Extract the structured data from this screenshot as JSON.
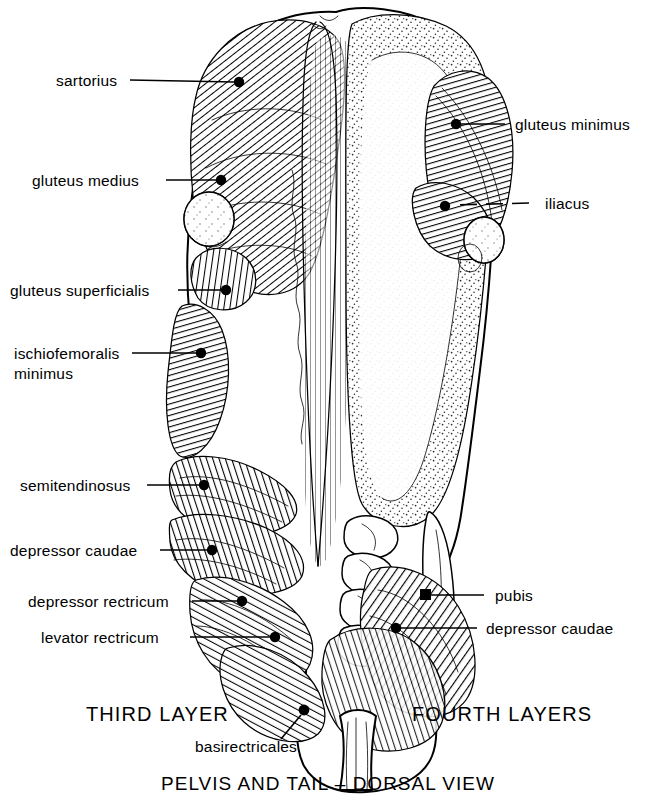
{
  "figure": {
    "title": "PELVIS AND TAIL – DORSAL VIEW",
    "left_caption": "THIRD  LAYER",
    "right_caption": "FOURTH LAYERS",
    "center_label": "basirectricales",
    "colors": {
      "ink": "#000000",
      "paper": "#ffffff"
    }
  },
  "labels_left": [
    {
      "id": "sartorius",
      "text": "sartorius"
    },
    {
      "id": "gluteus-medius",
      "text": "gluteus medius"
    },
    {
      "id": "gluteus-superficialis",
      "text": "gluteus superficialis"
    },
    {
      "id": "ischiofemoralis-minimus-line1",
      "text": "ischiofemoralis"
    },
    {
      "id": "ischiofemoralis-minimus-line2",
      "text": "minimus"
    },
    {
      "id": "semitendinosus",
      "text": "semitendinosus"
    },
    {
      "id": "depressor-caudae-left",
      "text": "depressor caudae"
    },
    {
      "id": "depressor-rectricum",
      "text": "depressor rectricum"
    },
    {
      "id": "levator-rectricum",
      "text": "levator rectricum"
    }
  ],
  "labels_right": [
    {
      "id": "gluteus-minimus",
      "text": "gluteus minimus"
    },
    {
      "id": "iliacus",
      "text": "iliacus"
    },
    {
      "id": "pubis",
      "text": "pubis"
    },
    {
      "id": "depressor-caudae-right",
      "text": "depressor caudae"
    }
  ]
}
